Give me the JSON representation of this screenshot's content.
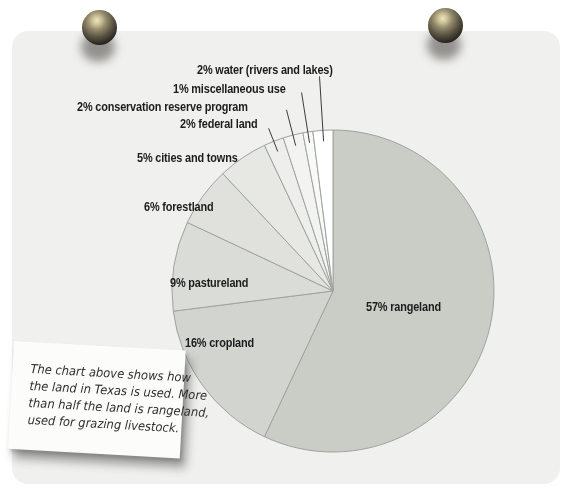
{
  "page": {
    "background_color": "#ffffff",
    "paper_color": "#f0f0ee"
  },
  "icons": {
    "pushpin": "round black pushpin with highlight and drop shadow"
  },
  "chart_data": {
    "type": "pie",
    "title": "",
    "direction": "clockwise",
    "start_angle_deg": 0,
    "legend_position": "labels around pie with leader lines for small slices",
    "stroke_color": "#9ea49e",
    "leader_line_color": "#3c3c3c",
    "label_color": "#1c1c1c",
    "slices": [
      {
        "name": "rangeland",
        "value": 57,
        "label": "57% rangeland",
        "color": "#c9cdc6"
      },
      {
        "name": "cropland",
        "value": 16,
        "label": "16% cropland",
        "color": "#d2d4d0"
      },
      {
        "name": "pastureland",
        "value": 9,
        "label": "9% pastureland",
        "color": "#dadcd8"
      },
      {
        "name": "forestland",
        "value": 6,
        "label": "6% forestland",
        "color": "#e0e1dd"
      },
      {
        "name": "cities and towns",
        "value": 5,
        "label": "5% cities and towns",
        "color": "#e7e8e4"
      },
      {
        "name": "federal land",
        "value": 2,
        "label": "2% federal land",
        "color": "#eeeeec"
      },
      {
        "name": "conservation reserve program",
        "value": 2,
        "label": "2% conservation reserve program",
        "color": "#f3f3f1"
      },
      {
        "name": "miscellaneous use",
        "value": 1,
        "label": "1% miscellaneous use",
        "color": "#f9f9f8"
      },
      {
        "name": "water (rivers and lakes)",
        "value": 2,
        "label": "2% water (rivers and lakes)",
        "color": "#ffffff"
      }
    ]
  },
  "note": {
    "lines": [
      "The chart above shows how",
      "the land in Texas is used. More",
      "than half the land is rangeland,",
      "used for grazing livestock."
    ]
  }
}
